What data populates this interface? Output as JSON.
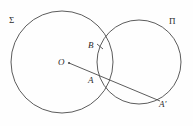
{
  "figure": {
    "type": "geometry-diagram",
    "background_color": "#fefefe",
    "stroke_color": "#4a4a4a",
    "label_color": "#2b2b2b",
    "width": 193,
    "height": 126,
    "circles": [
      {
        "name": "sigma",
        "label": "Σ",
        "cx": 62,
        "cy": 62,
        "r": 51
      },
      {
        "name": "pi",
        "label": "Π",
        "cx": 139,
        "cy": 62,
        "r": 42
      }
    ],
    "points": [
      {
        "name": "O",
        "label": "O",
        "x": 69,
        "y": 63,
        "has_dot": true
      },
      {
        "name": "B",
        "label": "B",
        "x": 99,
        "y": 47,
        "has_dot": false
      },
      {
        "name": "A",
        "label": "A",
        "x": 100,
        "y": 76,
        "has_dot": false
      },
      {
        "name": "Aprime",
        "label": "A′",
        "x": 159,
        "y": 100,
        "has_dot": false
      }
    ],
    "segments": [
      {
        "name": "O-to-Aprime",
        "x1": 69,
        "y1": 63,
        "x2": 160,
        "y2": 101
      }
    ],
    "ticks": [
      {
        "name": "tick-at-B",
        "x1": 97,
        "y1": 44,
        "x2": 103,
        "y2": 49
      }
    ],
    "labels": {
      "sigma": "Σ",
      "pi": "Π",
      "center": "O",
      "point_b": "B",
      "point_a": "A",
      "point_a_prime": "A′"
    }
  }
}
